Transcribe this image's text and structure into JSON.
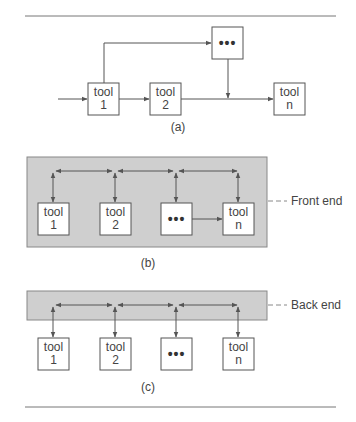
{
  "diagram": {
    "colors": {
      "line": "#555555",
      "panel": "#cfcfcf",
      "box_fill": "#ffffff",
      "rule": "#777777"
    },
    "panel_a": {
      "caption": "(a)",
      "boxes": [
        {
          "line1": "tool",
          "line2": "1"
        },
        {
          "line1": "tool",
          "line2": "2"
        },
        {
          "ellipsis": "•••"
        },
        {
          "line1": "tool",
          "line2": "n"
        }
      ]
    },
    "panel_b": {
      "caption": "(b)",
      "label": "Front end",
      "boxes": [
        {
          "line1": "tool",
          "line2": "1"
        },
        {
          "line1": "tool",
          "line2": "2"
        },
        {
          "ellipsis": "•••"
        },
        {
          "line1": "tool",
          "line2": "n"
        }
      ]
    },
    "panel_c": {
      "caption": "(c)",
      "label": "Back end",
      "boxes": [
        {
          "line1": "tool",
          "line2": "1"
        },
        {
          "line1": "tool",
          "line2": "2"
        },
        {
          "ellipsis": "•••"
        },
        {
          "line1": "tool",
          "line2": "n"
        }
      ]
    }
  }
}
